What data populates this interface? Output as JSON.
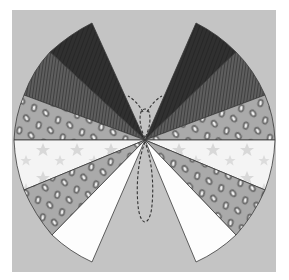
{
  "illustration": {
    "subject": "butterfly",
    "description": "Paper-craft butterfly made of pie-slice wing segments with textured patterns on a gray background",
    "colors": {
      "page": "#ffffff",
      "panel": "#c4c4c4",
      "dark_segment": "#2e2e2e",
      "striped_segment": "#5a5a5a",
      "leopard_segment": "#a9a9a9",
      "leopard_spot_ring": "#6e6e6e",
      "leopard_spot_center": "#f2f2f2",
      "star_segment": "#f4f4f4",
      "star": "#d6d6d6",
      "white_segment": "#fdfdfd",
      "outline": "#3a3a3a",
      "antenna": "#333333"
    },
    "wings": [
      {
        "side": "left",
        "segments": [
          "dark",
          "striped",
          "leopard",
          "stars",
          "leopard",
          "white"
        ]
      },
      {
        "side": "right",
        "segments": [
          "dark",
          "striped",
          "leopard",
          "stars",
          "leopard",
          "white"
        ]
      }
    ],
    "body": {
      "style": "dashed outline",
      "antennae": 2
    }
  }
}
